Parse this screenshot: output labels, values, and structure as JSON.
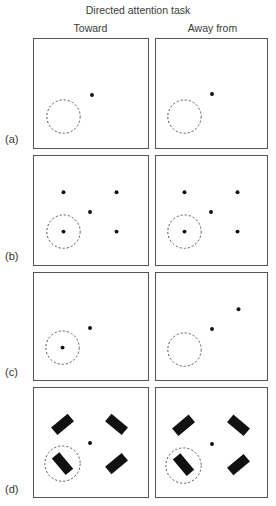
{
  "figure": {
    "title": "Directed attention task",
    "columns": [
      "Toward",
      "Away from"
    ],
    "rows": [
      {
        "label": "(a)",
        "description": "Single fixation point; attended location empty (dashed circle), no stimulus"
      },
      {
        "label": "(b)",
        "description": "Fixation point with four dots; one dot inside attended dashed circle"
      },
      {
        "label": "(c)",
        "description": "Single target dot: inside dashed circle (Toward) vs upper-right far from circle (Away from)"
      },
      {
        "label": "(d)",
        "description": "Four oriented black bars around fixation; one bar inside dashed circle"
      }
    ]
  },
  "colors": {
    "frame": "#555555",
    "dot": "#111111",
    "circle": "#555555",
    "bar": "#111111",
    "text": "#333333"
  }
}
